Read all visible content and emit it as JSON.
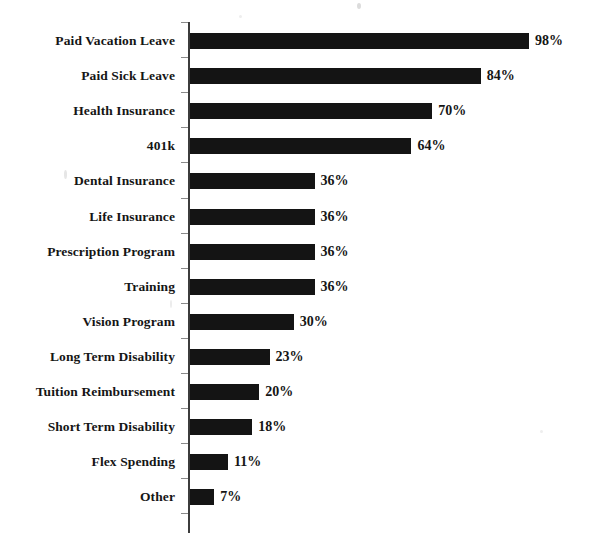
{
  "chart_data": {
    "type": "bar",
    "orientation": "horizontal",
    "title": "",
    "subtitle": "",
    "xlabel": "",
    "ylabel": "",
    "xlim": [
      0,
      100
    ],
    "grid": false,
    "legend": null,
    "value_suffix": "%",
    "bar_color": "#141414",
    "axis_color": "#3c3c3c",
    "background_color": "#ffffff",
    "categories": [
      "Paid Vacation Leave",
      "Paid Sick Leave",
      "Health Insurance",
      "401k",
      "Dental Insurance",
      "Life Insurance",
      "Prescription Program",
      "Training",
      "Vision Program",
      "Long Term Disability",
      "Tuition Reimbursement",
      "Short Term Disability",
      "Flex Spending",
      "Other"
    ],
    "values": [
      98,
      84,
      70,
      64,
      36,
      36,
      36,
      36,
      30,
      23,
      20,
      18,
      11,
      7
    ],
    "value_labels": [
      "98%",
      "84%",
      "70%",
      "64%",
      "36%",
      "36%",
      "36%",
      "36%",
      "30%",
      "23%",
      "20%",
      "18%",
      "11%",
      "7%"
    ]
  }
}
